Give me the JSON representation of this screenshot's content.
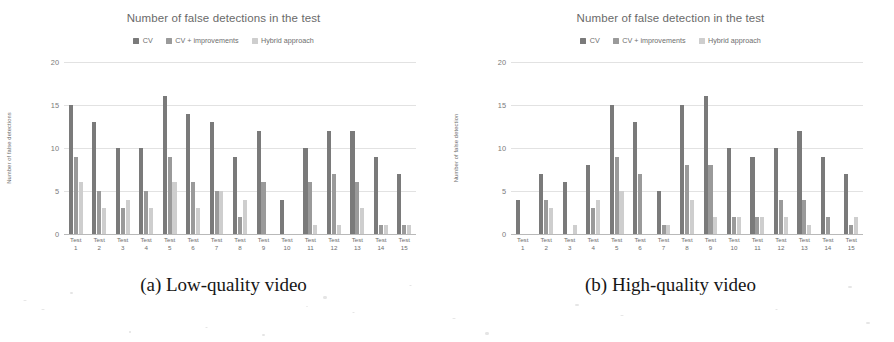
{
  "figure": {
    "captions": [
      {
        "id": "a",
        "text": "(a) Low-quality video"
      },
      {
        "id": "b",
        "text": "(b) High-quality video"
      }
    ]
  },
  "legend": {
    "items": [
      {
        "label": "CV",
        "color": "#7a7a7a"
      },
      {
        "label": "CV + improvements",
        "color": "#9a9a9a"
      },
      {
        "label": "Hybrid approach",
        "color": "#cecece"
      }
    ]
  },
  "panels": [
    {
      "id": "low-quality",
      "title": "Number of false detections in the test",
      "ylabel": "Number of false detections",
      "yticks": [
        "0",
        "5",
        "10",
        "15",
        "20"
      ]
    },
    {
      "id": "high-quality",
      "title": "Number of false detection in the test",
      "ylabel": "Number of false detection",
      "yticks": [
        "0",
        "5",
        "10",
        "15",
        "20"
      ]
    }
  ],
  "chart_data": [
    {
      "type": "bar",
      "title": "Number of false detections in the test",
      "caption": "(a) Low-quality video",
      "xlabel": "",
      "ylabel": "Number of false detections",
      "ylim": [
        0,
        20
      ],
      "yticks": [
        0,
        5,
        10,
        15,
        20
      ],
      "grid": true,
      "legend_position": "top-center",
      "categories": [
        "Test 1",
        "Test 2",
        "Test 3",
        "Test 4",
        "Test 5",
        "Test 6",
        "Test 7",
        "Test 8",
        "Test 9",
        "Test 10",
        "Test 11",
        "Test 12",
        "Test 13",
        "Test 14",
        "Test 15"
      ],
      "series": [
        {
          "name": "CV",
          "color": "#7a7a7a",
          "values": [
            15,
            13,
            10,
            10,
            16,
            14,
            13,
            9,
            12,
            4,
            10,
            12,
            12,
            9,
            7
          ]
        },
        {
          "name": "CV + improvements",
          "color": "#9a9a9a",
          "values": [
            9,
            5,
            3,
            5,
            9,
            6,
            5,
            2,
            6,
            0,
            6,
            7,
            6,
            1,
            1
          ]
        },
        {
          "name": "Hybrid approach",
          "color": "#cecece",
          "values": [
            6,
            3,
            4,
            3,
            6,
            3,
            5,
            4,
            0,
            0,
            1,
            1,
            3,
            1,
            1
          ]
        }
      ]
    },
    {
      "type": "bar",
      "title": "Number of false detection in the test",
      "caption": "(b) High-quality video",
      "xlabel": "",
      "ylabel": "Number of false detection",
      "ylim": [
        0,
        20
      ],
      "yticks": [
        0,
        5,
        10,
        15,
        20
      ],
      "grid": true,
      "legend_position": "top-center",
      "categories": [
        "Test 1",
        "Test 2",
        "Test 3",
        "Test 4",
        "Test 5",
        "Test 6",
        "Test 7",
        "Test 8",
        "Test 9",
        "Test 10",
        "Test 11",
        "Test 12",
        "Test 13",
        "Test 14",
        "Test 15"
      ],
      "series": [
        {
          "name": "CV",
          "color": "#7a7a7a",
          "values": [
            4,
            7,
            6,
            8,
            15,
            13,
            5,
            15,
            16,
            10,
            9,
            10,
            12,
            9,
            7
          ]
        },
        {
          "name": "CV + improvements",
          "color": "#9a9a9a",
          "values": [
            0,
            4,
            0,
            3,
            9,
            7,
            1,
            8,
            8,
            2,
            2,
            4,
            4,
            2,
            1
          ]
        },
        {
          "name": "Hybrid approach",
          "color": "#cecece",
          "values": [
            0,
            3,
            1,
            4,
            5,
            0,
            1,
            4,
            2,
            2,
            2,
            2,
            1,
            0,
            2
          ]
        }
      ]
    }
  ]
}
